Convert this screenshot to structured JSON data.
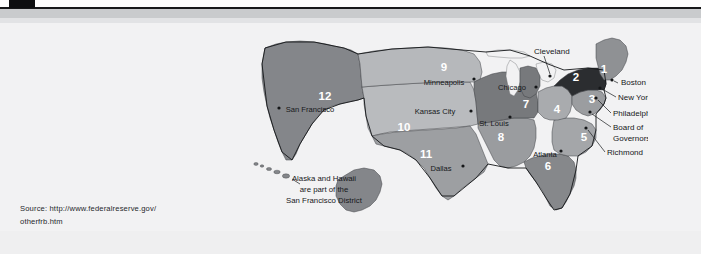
{
  "page": {
    "background_color": "#f2f2f3",
    "header_rule_color": "#17181a",
    "header_band_color": "#c9cbcd"
  },
  "source": {
    "line1": "Source: http://www.federalreserve.gov/",
    "line2": "otherfrb.htm"
  },
  "map": {
    "title": "Federal Reserve Districts",
    "annotation": {
      "line1": "Alaska and Hawaii",
      "line2": "are part of the",
      "line3": "San Francisco District"
    },
    "districts": [
      {
        "number": "1",
        "city": "Boston",
        "fill": "#8f9194",
        "num_x": 356,
        "num_y": 45
      },
      {
        "number": "2",
        "city": "New York",
        "fill": "#2b2d30",
        "num_x": 328,
        "num_y": 53
      },
      {
        "number": "3",
        "city": "Philadelphia",
        "fill": "#9b9da0",
        "num_x": 344,
        "num_y": 75
      },
      {
        "number": "4",
        "city": "Cleveland",
        "fill": "#a9abae",
        "num_x": 309,
        "num_y": 85
      },
      {
        "number": "5",
        "city": "Richmond",
        "fill": "#a4a6a9",
        "num_x": 336,
        "num_y": 113
      },
      {
        "number": "6",
        "city": "Atlanta",
        "fill": "#86888b",
        "num_x": 300,
        "num_y": 142
      },
      {
        "number": "7",
        "city": "Chicago",
        "fill": "#77797c",
        "num_x": 278,
        "num_y": 80
      },
      {
        "number": "8",
        "city": "St. Louis",
        "fill": "#9a9c9f",
        "num_x": 253,
        "num_y": 113
      },
      {
        "number": "9",
        "city": "Minneapolis",
        "fill": "#b6b8bb",
        "num_x": 196,
        "num_y": 43
      },
      {
        "number": "10",
        "city": "Kansas City",
        "fill": "#b9bbbe",
        "num_x": 156,
        "num_y": 103
      },
      {
        "number": "11",
        "city": "Dallas",
        "fill": "#9d9fa2",
        "num_x": 178,
        "num_y": 130
      },
      {
        "number": "12",
        "city": "San Francisco",
        "fill": "#84868a",
        "num_x": 77,
        "num_y": 72
      }
    ],
    "city_labels": [
      {
        "name": "Minneapolis",
        "x": 196,
        "y": 58,
        "dot_x": 226,
        "dot_y": 55
      },
      {
        "name": "Chicago",
        "x": 264,
        "y": 65,
        "dot_x": 288,
        "dot_y": 63
      },
      {
        "name": "Kansas City",
        "x": 187,
        "y": 89,
        "dot_x": 223,
        "dot_y": 87
      },
      {
        "name": "St. Louis",
        "x": 248,
        "y": 101,
        "dot_x": 262,
        "dot_y": 93
      },
      {
        "name": "Dallas",
        "x": 193,
        "y": 145,
        "dot_x": 215,
        "dot_y": 142
      },
      {
        "name": "Atlanta",
        "x": 297,
        "y": 132,
        "dot_x": 313,
        "dot_y": 127
      },
      {
        "name": "San Francisco",
        "x": 79,
        "y": 87,
        "dot_x": 31,
        "dot_y": 84
      }
    ],
    "callout_labels": [
      {
        "name": "Cleveland",
        "x": 286,
        "y": 28
      },
      {
        "name": "Boston",
        "x": 375,
        "y": 62
      },
      {
        "name": "New York",
        "x": 372,
        "y": 76
      },
      {
        "name": "Philadelphia",
        "x": 366,
        "y": 92
      },
      {
        "name": "Board of",
        "x": 366,
        "y": 106
      },
      {
        "name": "Governors",
        "x": 366,
        "y": 117
      },
      {
        "name": "Richmond",
        "x": 360,
        "y": 131
      }
    ],
    "colors": {
      "water": "#f2f2f3",
      "border": "#4a4c4f",
      "outline": "#141618",
      "label_text": "#16181a",
      "number_text": "#ffffff"
    }
  }
}
